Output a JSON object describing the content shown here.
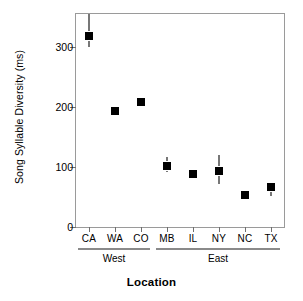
{
  "chart_data": {
    "type": "scatter",
    "title": "",
    "xlabel": "Location",
    "ylabel": "Song Syllable Diversity (ms)",
    "categories": [
      "CA",
      "WA",
      "CO",
      "MB",
      "IL",
      "NY",
      "NC",
      "TX"
    ],
    "values": [
      320,
      195,
      210,
      103,
      90,
      95,
      55,
      68
    ],
    "error_low": [
      300,
      190,
      206,
      92,
      87,
      72,
      50,
      52
    ],
    "error_high": [
      355,
      200,
      214,
      116,
      93,
      120,
      60,
      74
    ],
    "ylim": [
      0,
      355
    ],
    "yticks": [
      0,
      100,
      200,
      300
    ],
    "ytick_labels": [
      "0",
      "100",
      "200",
      "300"
    ],
    "grid": false,
    "legend": false,
    "marker_color": "#000000",
    "errorbar_color": "#777777",
    "axis_color": "#9a9a9a",
    "groups": [
      {
        "label": "West",
        "members": [
          "CA",
          "WA",
          "CO"
        ]
      },
      {
        "label": "East",
        "members": [
          "MB",
          "IL",
          "NY",
          "NC",
          "TX"
        ]
      }
    ]
  }
}
